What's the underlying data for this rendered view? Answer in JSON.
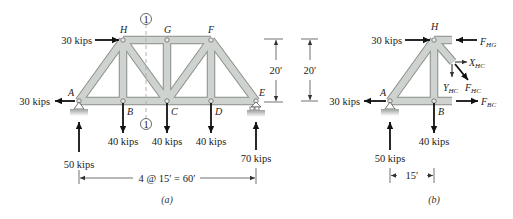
{
  "figure": {
    "panel_a": {
      "caption": "(a)",
      "nodes": {
        "A": "A",
        "B": "B",
        "C": "C",
        "D": "D",
        "E": "E",
        "F": "F",
        "G": "G",
        "H": "H"
      },
      "section_marker": "1",
      "loads": {
        "H_horizontal": "30 kips",
        "A_horizontal": "30 kips",
        "A_reaction": "50 kips",
        "B_load": "40 kips",
        "C_load": "40 kips",
        "D_load": "40 kips",
        "E_reaction": "70 kips"
      },
      "dimensions": {
        "span": "4 @ 15′ = 60′",
        "height": "20′"
      }
    },
    "panel_b": {
      "caption": "(b)",
      "nodes": {
        "A": "A",
        "B": "B",
        "H": "H"
      },
      "height": "20′",
      "loads": {
        "H_horizontal": "30 kips",
        "A_horizontal": "30 kips",
        "A_reaction": "50 kips",
        "B_load": "40 kips"
      },
      "forces": {
        "FHG_main": "F",
        "FHG_sub": "HG",
        "XHC_main": "X",
        "XHC_sub": "HC",
        "YHC_main": "Y",
        "YHC_sub": "HC",
        "FHC_main": "F",
        "FHC_sub": "HC",
        "FBC_main": "F",
        "FBC_sub": "BC"
      },
      "dimension": "15′"
    }
  },
  "colors": {
    "member_fill": "#c9cdc9",
    "member_stroke": "#8a8f8a",
    "arrow": "#111111",
    "text": "#222222",
    "section_line": "#aaaaaa"
  }
}
